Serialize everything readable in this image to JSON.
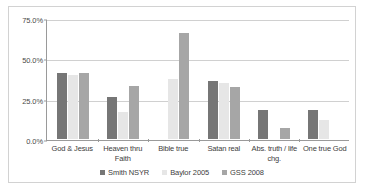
{
  "chart_data": {
    "type": "bar",
    "title": "",
    "subtitle": "",
    "xlabel": "",
    "ylabel": "",
    "ylim": [
      0,
      75
    ],
    "ytick_labels": [
      "0.0%",
      "25.0%",
      "50.0%",
      "75.0%"
    ],
    "ytick_values": [
      0,
      25,
      50,
      75
    ],
    "grid": true,
    "legend_position": "bottom",
    "categories": [
      "God & Jesus",
      "Heaven thru Faith",
      "Bible true",
      "Satan real",
      "Abs. truth / life chg.",
      "One true God"
    ],
    "series": [
      {
        "name": "Smith NSYR",
        "color": "#767676",
        "values": [
          41.0,
          26.0,
          null,
          36.0,
          18.0,
          18.0
        ]
      },
      {
        "name": "Baylor 2005",
        "color": "#e6e6e6",
        "values": [
          39.5,
          17.0,
          37.5,
          35.0,
          null,
          11.5
        ]
      },
      {
        "name": "GSS 2008",
        "color": "#a6a6a6",
        "values": [
          41.0,
          33.0,
          66.0,
          32.0,
          7.0,
          null
        ]
      }
    ]
  },
  "axis": {
    "y_ticks": [
      {
        "label": "75.0%",
        "value": 75
      },
      {
        "label": "50.0%",
        "value": 50
      },
      {
        "label": "25.0%",
        "value": 25
      },
      {
        "label": "0.0%",
        "value": 0
      }
    ]
  },
  "legend": {
    "items": [
      {
        "label": "Smith NSYR",
        "series": 0
      },
      {
        "label": "Baylor 2005",
        "series": 1
      },
      {
        "label": "GSS 2008",
        "series": 2
      }
    ]
  },
  "colors": {
    "series_0": "#767676",
    "series_1": "#e6e6e6",
    "series_2": "#a6a6a6",
    "gridline": "#d0d0d0",
    "axis": "#9a9a9a",
    "frame": "#d2d2d2",
    "text": "#3d3d3d"
  }
}
